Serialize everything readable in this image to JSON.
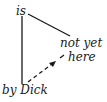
{
  "diagram": {
    "type": "sentence-diagram",
    "nodes": [
      {
        "id": "is",
        "label": "is"
      },
      {
        "id": "not_yet",
        "label": "not yet"
      },
      {
        "id": "here",
        "label": "here"
      },
      {
        "id": "by_dick",
        "label": "by Dick"
      }
    ],
    "edges": [
      {
        "from": "is",
        "to": "by_dick",
        "style": "solid"
      },
      {
        "from": "is",
        "to": "not_yet",
        "style": "solid"
      },
      {
        "from": "by_dick",
        "to": "here",
        "style": "dashed-arrow"
      }
    ],
    "colors": {
      "ink": "#1a1a1a",
      "background": "#ffffff"
    }
  }
}
